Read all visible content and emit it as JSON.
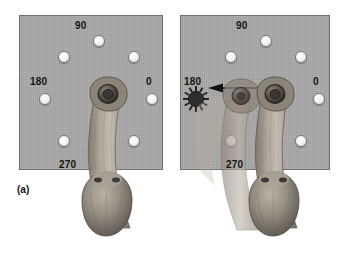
{
  "figure": {
    "label": "(a)",
    "background_color": "#ffffff",
    "panel_color": "#a8a8a8",
    "panel_border_color": "#6f6f6f",
    "led_color": "#f4f4f4",
    "flash_color": "#2e2e2e",
    "arrow_color": "#111111",
    "fur_color": "#9a9288"
  },
  "panels": [
    {
      "id": "left",
      "name": "baseline-panel",
      "caption": "",
      "targets": [
        {
          "angle_label": "0",
          "angle_deg": 0,
          "x": 126,
          "y": 77,
          "label_x": 127,
          "label_y": 62,
          "lit": false
        },
        {
          "angle_label": "",
          "angle_deg": 45,
          "x": 108,
          "y": 35,
          "label_x": null,
          "label_y": null,
          "lit": false
        },
        {
          "angle_label": "90",
          "angle_deg": 90,
          "x": 73,
          "y": 19,
          "label_x": 56,
          "label_y": 6,
          "lit": false
        },
        {
          "angle_label": "",
          "angle_deg": 135,
          "x": 38,
          "y": 35,
          "label_x": null,
          "label_y": null,
          "lit": false
        },
        {
          "angle_label": "180",
          "angle_deg": 180,
          "x": 19,
          "y": 77,
          "label_x": 11,
          "label_y": 62,
          "lit": false
        },
        {
          "angle_label": "",
          "angle_deg": 225,
          "x": 38,
          "y": 119,
          "label_x": null,
          "label_y": null,
          "lit": false
        },
        {
          "angle_label": "270",
          "angle_deg": 270,
          "x": 73,
          "y": 136,
          "label_x": 40,
          "label_y": 145,
          "lit": false
        },
        {
          "angle_label": "",
          "angle_deg": 315,
          "x": 108,
          "y": 119,
          "label_x": null,
          "label_y": null,
          "lit": false
        }
      ],
      "flash": null,
      "arrow": null,
      "arm_positions": 1
    },
    {
      "id": "right",
      "name": "reach-panel",
      "caption": "",
      "targets": [
        {
          "angle_label": "0",
          "angle_deg": 0,
          "x": 132,
          "y": 77,
          "label_x": 133,
          "label_y": 62,
          "lit": false
        },
        {
          "angle_label": "",
          "angle_deg": 45,
          "x": 114,
          "y": 35,
          "label_x": null,
          "label_y": null,
          "lit": false
        },
        {
          "angle_label": "90",
          "angle_deg": 90,
          "x": 79,
          "y": 19,
          "label_x": 61,
          "label_y": 6,
          "lit": false
        },
        {
          "angle_label": "",
          "angle_deg": 135,
          "x": 44,
          "y": 35,
          "label_x": null,
          "label_y": null,
          "lit": false
        },
        {
          "angle_label": "180",
          "angle_deg": 180,
          "x": 9,
          "y": 77,
          "label_x": 5,
          "label_y": 62,
          "lit": true
        },
        {
          "angle_label": "",
          "angle_deg": 225,
          "x": 44,
          "y": 119,
          "label_x": null,
          "label_y": null,
          "lit": false
        },
        {
          "angle_label": "270",
          "angle_deg": 270,
          "x": 79,
          "y": 136,
          "label_x": 46,
          "label_y": 145,
          "lit": false
        },
        {
          "angle_label": "",
          "angle_deg": 315,
          "x": 114,
          "y": 119,
          "label_x": null,
          "label_y": null,
          "lit": false
        }
      ],
      "flash": {
        "x": 2,
        "y": 70,
        "rays": 12,
        "name": "target-flash"
      },
      "arrow": {
        "x": 26,
        "y": 68,
        "width": 58,
        "direction": "left",
        "name": "movement-direction-arrow"
      },
      "arm_positions": 2
    }
  ]
}
